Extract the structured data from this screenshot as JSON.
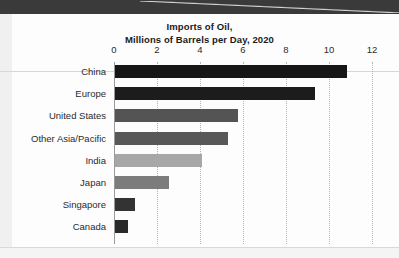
{
  "chart_data": {
    "type": "bar",
    "orientation": "horizontal",
    "title": "Imports of Oil,\nMillions of Barrels per Day, 2020",
    "title_line1": "Imports of Oil,",
    "title_line2": "Millions of Barrels per Day, 2020",
    "xlabel": "",
    "ylabel": "",
    "xlim": [
      0,
      12
    ],
    "xticks": [
      0,
      2,
      4,
      6,
      8,
      10,
      12
    ],
    "xtick_labels": [
      "0",
      "2",
      "4",
      "6",
      "8",
      "10",
      "12"
    ],
    "grid": "vertical-dotted",
    "legend": "none",
    "categories": [
      "China",
      "Europe",
      "United States",
      "Other Asia/Pacific",
      "India",
      "Japan",
      "Singapore",
      "Canada"
    ],
    "values": [
      10.8,
      9.3,
      5.7,
      5.25,
      4.05,
      2.5,
      0.95,
      0.6
    ],
    "bar_colors": [
      "#161616",
      "#1c1c1c",
      "#545454",
      "#585858",
      "#a7a7a7",
      "#7c7c7c",
      "#333333",
      "#2a2a2a"
    ],
    "bars": [
      {
        "label": "China",
        "value": 10.8,
        "color": "#161616"
      },
      {
        "label": "Europe",
        "value": 9.3,
        "color": "#1c1c1c"
      },
      {
        "label": "United States",
        "value": 5.7,
        "color": "#545454"
      },
      {
        "label": "Other Asia/Pacific",
        "value": 5.25,
        "color": "#585858"
      },
      {
        "label": "India",
        "value": 4.05,
        "color": "#a7a7a7"
      },
      {
        "label": "Japan",
        "value": 2.5,
        "color": "#7c7c7c"
      },
      {
        "label": "Singapore",
        "value": 0.95,
        "color": "#333333"
      },
      {
        "label": "Canada",
        "value": 0.6,
        "color": "#2a2a2a"
      }
    ]
  },
  "page": {
    "background_color": "#fdfdfd",
    "band_color": "#3a3a3a",
    "rule_color": "#d7d7d7"
  }
}
